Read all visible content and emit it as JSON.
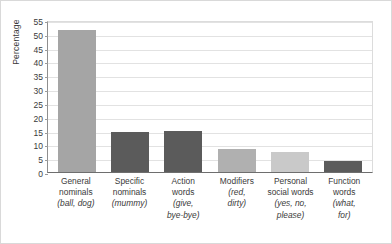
{
  "chart_data": {
    "type": "bar",
    "title": "",
    "xlabel": "",
    "ylabel": "Percentage",
    "ylim": [
      0,
      55
    ],
    "ytick_step": 5,
    "yticks": [
      55,
      50,
      45,
      40,
      35,
      30,
      25,
      20,
      15,
      10,
      5,
      0
    ],
    "grid": true,
    "legend": false,
    "categories": [
      "General nominals (ball, dog)",
      "Specific nominals (mummy)",
      "Action words (give, bye-bye)",
      "Modifiers (red, dirty)",
      "Personal social words (yes, no, please)",
      "Function words (what, for)"
    ],
    "values": [
      51.5,
      14.3,
      14.8,
      8.3,
      7.4,
      4.1
    ],
    "colors": [
      "#a5a5a5",
      "#5b5b5b",
      "#5b5b5b",
      "#b0b0b0",
      "#c9c9c9",
      "#5b5b5b"
    ]
  },
  "axis": {
    "y_title": "Percentage"
  },
  "bars": [
    {
      "name": "general-nominals",
      "value": 51.5,
      "color": "#a5a5a5",
      "label_lines": [
        {
          "text": "General",
          "italic": false
        },
        {
          "text": "nominals",
          "italic": false
        },
        {
          "text": "(ball, dog)",
          "italic": true
        }
      ]
    },
    {
      "name": "specific-nominals",
      "value": 14.3,
      "color": "#5b5b5b",
      "label_lines": [
        {
          "text": "Specific",
          "italic": false
        },
        {
          "text": "nominals",
          "italic": false
        },
        {
          "text": "(mummy)",
          "italic": true
        }
      ]
    },
    {
      "name": "action-words",
      "value": 14.8,
      "color": "#5b5b5b",
      "label_lines": [
        {
          "text": "Action",
          "italic": false
        },
        {
          "text": "words",
          "italic": false
        },
        {
          "text": "(give,",
          "italic": true
        },
        {
          "text": "bye-bye)",
          "italic": true
        }
      ]
    },
    {
      "name": "modifiers",
      "value": 8.3,
      "color": "#b0b0b0",
      "label_lines": [
        {
          "text": "Modifiers",
          "italic": false
        },
        {
          "text": "(red,",
          "italic": true
        },
        {
          "text": "dirty)",
          "italic": true
        }
      ]
    },
    {
      "name": "personal-social-words",
      "value": 7.4,
      "color": "#c9c9c9",
      "label_lines": [
        {
          "text": "Personal",
          "italic": false
        },
        {
          "text": "social words",
          "italic": false
        },
        {
          "text": "(yes, no,",
          "italic": true
        },
        {
          "text": "please)",
          "italic": true
        }
      ]
    },
    {
      "name": "function-words",
      "value": 4.1,
      "color": "#5b5b5b",
      "label_lines": [
        {
          "text": "Function",
          "italic": false
        },
        {
          "text": "words",
          "italic": false
        },
        {
          "text": "(what,",
          "italic": true
        },
        {
          "text": "for)",
          "italic": true
        }
      ]
    }
  ]
}
